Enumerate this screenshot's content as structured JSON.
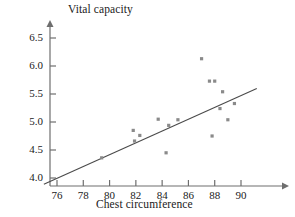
{
  "chart_data": {
    "type": "scatter",
    "title": "",
    "xlabel": "Chest circumference",
    "ylabel": "Vital capacity",
    "xlim": [
      74.5,
      92.0
    ],
    "ylim": [
      3.85,
      6.7
    ],
    "xticks": [
      76,
      78,
      80,
      82,
      84,
      86,
      88,
      90
    ],
    "yticks": [
      4.0,
      4.5,
      5.0,
      5.5,
      6.0,
      6.5
    ],
    "xtick_labels": [
      "76",
      "78",
      "80",
      "82",
      "84",
      "86",
      "88",
      "90"
    ],
    "ytick_labels": [
      "4.0",
      "4.5",
      "5.0",
      "5.5",
      "6.0",
      "6.5"
    ],
    "grid": false,
    "legend": false,
    "marker": "square",
    "marker_color": "#8a8a8a",
    "axis_color": "#6e6e6e",
    "line_color": "#4a4a4a",
    "points": [
      {
        "x": 79.4,
        "y": 4.36
      },
      {
        "x": 81.8,
        "y": 4.85
      },
      {
        "x": 81.9,
        "y": 4.66
      },
      {
        "x": 82.3,
        "y": 4.76
      },
      {
        "x": 83.7,
        "y": 5.05
      },
      {
        "x": 84.3,
        "y": 4.45
      },
      {
        "x": 84.5,
        "y": 4.94
      },
      {
        "x": 85.2,
        "y": 5.04
      },
      {
        "x": 87.0,
        "y": 6.13
      },
      {
        "x": 87.6,
        "y": 5.73
      },
      {
        "x": 88.0,
        "y": 5.73
      },
      {
        "x": 87.8,
        "y": 4.75
      },
      {
        "x": 88.6,
        "y": 5.54
      },
      {
        "x": 88.4,
        "y": 5.24
      },
      {
        "x": 89.0,
        "y": 5.04
      },
      {
        "x": 89.5,
        "y": 5.33
      }
    ],
    "trend_line": {
      "label": "least-squares regression line",
      "x_start": 75.0,
      "y_start": 3.89,
      "x_end": 91.2,
      "y_end": 5.6
    }
  }
}
